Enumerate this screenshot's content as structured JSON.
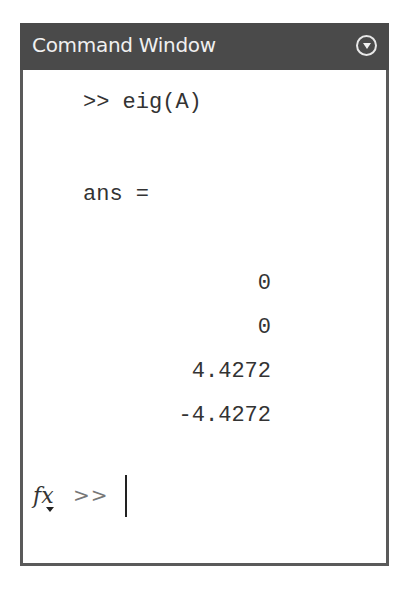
{
  "window": {
    "title": "Command Window",
    "menu_icon": "circle-chevron-down-icon"
  },
  "console": {
    "command": ">> eig(A)",
    "output_label": "ans =",
    "values": [
      "0",
      "0",
      "4.4272",
      "-4.4272"
    ]
  },
  "input": {
    "fx_icon": "fx",
    "prompt": ">>",
    "value": ""
  },
  "colors": {
    "titlebar_bg": "#4a4a4a",
    "titlebar_text": "#f0f0f0",
    "border": "#5a5a5a",
    "text": "#333333"
  }
}
